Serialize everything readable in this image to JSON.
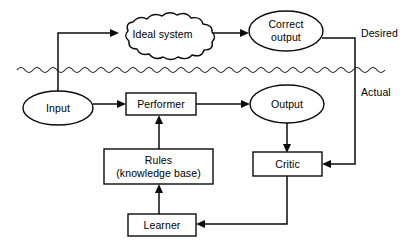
{
  "diagram": {
    "line_color": "#0b0b0b",
    "background_color": "#ffffff",
    "regions": {
      "desired_label": "Desired",
      "actual_label": "Actual"
    },
    "nodes": {
      "ideal_system": {
        "label": "Ideal system",
        "shape": "cloud"
      },
      "correct_output": {
        "label_line1": "Correct",
        "label_line2": "output",
        "shape": "ellipse"
      },
      "input": {
        "label": "Input",
        "shape": "ellipse"
      },
      "performer": {
        "label": "Performer",
        "shape": "rectangle"
      },
      "output": {
        "label": "Output",
        "shape": "ellipse"
      },
      "rules": {
        "label_line1": "Rules",
        "label_line2": "(knowledge base)",
        "shape": "rectangle"
      },
      "critic": {
        "label": "Critic",
        "shape": "rectangle"
      },
      "learner": {
        "label": "Learner",
        "shape": "rectangle"
      }
    },
    "edges": [
      {
        "from": "input",
        "to": "ideal_system",
        "style": "elbow-up-right",
        "arrow": true
      },
      {
        "from": "ideal_system",
        "to": "correct_output",
        "style": "straight-right",
        "arrow": true
      },
      {
        "from": "correct_output",
        "to": "critic",
        "style": "elbow-right-down-left",
        "arrow": true
      },
      {
        "from": "input",
        "to": "performer",
        "style": "straight-right",
        "arrow": true
      },
      {
        "from": "performer",
        "to": "output",
        "style": "straight-right",
        "arrow": true
      },
      {
        "from": "output",
        "to": "critic",
        "style": "straight-down",
        "arrow": true
      },
      {
        "from": "critic",
        "to": "learner",
        "style": "elbow-down-left",
        "arrow": true
      },
      {
        "from": "learner",
        "to": "rules",
        "style": "straight-up",
        "arrow": true
      },
      {
        "from": "rules",
        "to": "performer",
        "style": "straight-up",
        "arrow": true
      }
    ]
  }
}
